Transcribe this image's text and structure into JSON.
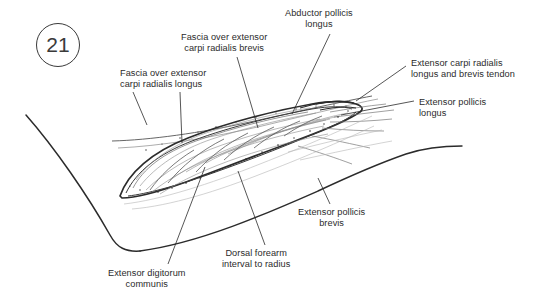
{
  "figure": {
    "number": "21",
    "type": "anatomical-illustration",
    "background_color": "#ffffff",
    "ink_color": "#2b2b2b",
    "line_color_light": "#9a9a9a"
  },
  "labels": [
    {
      "id": "fascia-ecrl",
      "lines": [
        "Fascia over extensor",
        "carpi radialis longus"
      ],
      "align": "left",
      "x": 120,
      "y": 68,
      "leaders": [
        {
          "x1": 133,
          "y1": 92,
          "x2": 147,
          "y2": 125
        },
        {
          "x1": 180,
          "y1": 92,
          "x2": 182,
          "y2": 143
        }
      ]
    },
    {
      "id": "fascia-ecrb",
      "lines": [
        "Fascia over extensor",
        "carpi radialis brevis"
      ],
      "align": "center",
      "x": 181,
      "y": 32,
      "leaders": [
        {
          "x1": 237,
          "y1": 57,
          "x2": 258,
          "y2": 128
        }
      ]
    },
    {
      "id": "abductor-pollicis-longus",
      "lines": [
        "Abductor pollicis",
        "longus"
      ],
      "align": "center",
      "x": 285,
      "y": 8,
      "leaders": [
        {
          "x1": 330,
          "y1": 34,
          "x2": 292,
          "y2": 114
        }
      ]
    },
    {
      "id": "ecrl-ecrb-tendon",
      "lines": [
        "Extensor carpi radialis",
        "longus and brevis tendon"
      ],
      "align": "left",
      "x": 411,
      "y": 58,
      "leaders": [
        {
          "x1": 406,
          "y1": 66,
          "x2": 356,
          "y2": 101
        }
      ]
    },
    {
      "id": "extensor-pollicis-longus",
      "lines": [
        "Extensor pollicis",
        "longus"
      ],
      "align": "left",
      "x": 419,
      "y": 97,
      "leaders": [
        {
          "x1": 414,
          "y1": 101,
          "x2": 341,
          "y2": 115
        }
      ]
    },
    {
      "id": "extensor-pollicis-brevis",
      "lines": [
        "Extensor pollicis",
        "brevis"
      ],
      "align": "center",
      "x": 298,
      "y": 207,
      "leaders": [
        {
          "x1": 330,
          "y1": 204,
          "x2": 318,
          "y2": 178
        }
      ]
    },
    {
      "id": "dorsal-forearm-interval",
      "lines": [
        "Dorsal forearm",
        "interval to radius"
      ],
      "align": "center",
      "x": 222,
      "y": 248,
      "leaders": [
        {
          "x1": 265,
          "y1": 245,
          "x2": 238,
          "y2": 171
        }
      ]
    },
    {
      "id": "extensor-digitorum-communis",
      "lines": [
        "Extensor digitorum",
        "communis"
      ],
      "align": "center",
      "x": 108,
      "y": 268,
      "leaders": [
        {
          "x1": 168,
          "y1": 264,
          "x2": 205,
          "y2": 167
        }
      ]
    }
  ]
}
